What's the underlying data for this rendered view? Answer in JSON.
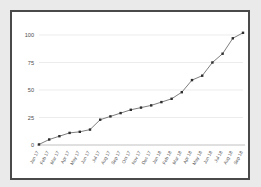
{
  "chart_data": {
    "type": "line",
    "title": "",
    "subtitle": "",
    "xlabel": "",
    "ylabel": "",
    "ylim": [
      0,
      110
    ],
    "yticks": [
      0,
      25,
      50,
      75,
      100
    ],
    "grid": true,
    "legend": false,
    "legend_position": "none",
    "marker": "square",
    "line_color": "#6f6f6f",
    "marker_color": "#2e2e2e",
    "categories": [
      "Jan 17",
      "Feb 17",
      "Mar 17",
      "Apr 17",
      "May 17",
      "Jun 17",
      "Jul 17",
      "Aug 17",
      "Sep 17",
      "Oct 17",
      "Nov 17",
      "Dec 17",
      "Jan 18",
      "Feb 18",
      "Mar 18",
      "Apr 18",
      "May 18",
      "Jun 18",
      "Jul 18",
      "Aug 18",
      "Sep 18"
    ],
    "values": [
      0.5,
      5,
      8,
      11,
      12,
      14,
      23,
      26,
      29,
      32,
      34,
      36,
      39,
      42,
      48,
      59,
      63,
      75,
      83,
      97,
      102
    ],
    "series": [
      {
        "name": "series-1",
        "values": [
          0.5,
          5,
          8,
          11,
          12,
          14,
          23,
          26,
          29,
          32,
          34,
          36,
          39,
          42,
          48,
          59,
          63,
          75,
          83,
          97,
          102
        ]
      }
    ]
  }
}
